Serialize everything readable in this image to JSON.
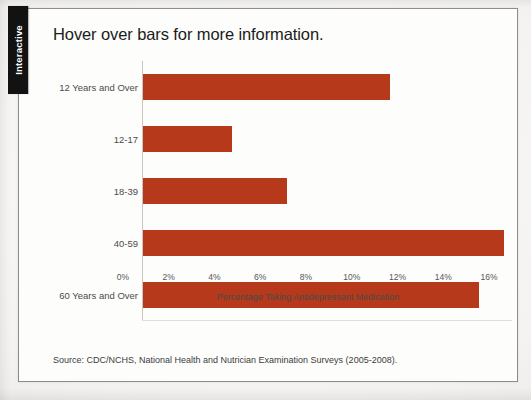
{
  "sidebar": {
    "tab_label": "Interactive"
  },
  "figure": {
    "title": "Hover over bars for more information.",
    "source": "Source: CDC/NCHS, National Health and Nutrician Examination Surveys (2005-2008)."
  },
  "chart_data": {
    "type": "bar",
    "orientation": "horizontal",
    "title": "Hover over bars for more information.",
    "xlabel": "Percentage Taking Antidepressant Medication",
    "ylabel": "",
    "categories": [
      "12 Years and Over",
      "12-17",
      "18-39",
      "40-59",
      "60 Years and Over"
    ],
    "values": [
      10.8,
      3.9,
      6.3,
      15.8,
      14.7
    ],
    "xlim": [
      0,
      16
    ],
    "xticks": [
      0,
      2,
      4,
      6,
      8,
      10,
      12,
      14,
      16
    ],
    "xtick_labels": [
      "0%",
      "2%",
      "4%",
      "6%",
      "8%",
      "10%",
      "12%",
      "14%",
      "16%"
    ],
    "grid": false,
    "legend": false,
    "bar_color": "#b5391a",
    "background_color": "#fdfdfc"
  }
}
